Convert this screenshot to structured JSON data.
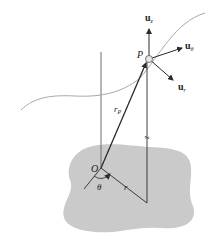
{
  "figure": {
    "type": "cylindrical coordinate diagram",
    "colors": {
      "background": "#ffffff",
      "plane": "#c9c9c9",
      "curve": "#a8a8a8",
      "axis": "#6e6e6e",
      "vector": "#2a2a2a",
      "point_fill": "#e8e8e8"
    },
    "labels": {
      "u_z": {
        "base": "u",
        "sub": "z"
      },
      "u_theta": {
        "base": "u",
        "sub": "θ"
      },
      "u_r": {
        "base": "u",
        "sub": "r"
      },
      "point": "P",
      "origin": "O",
      "position_vector": {
        "base": "r",
        "sub": "P"
      },
      "height": "z",
      "radius": "r",
      "angle": "θ"
    }
  }
}
